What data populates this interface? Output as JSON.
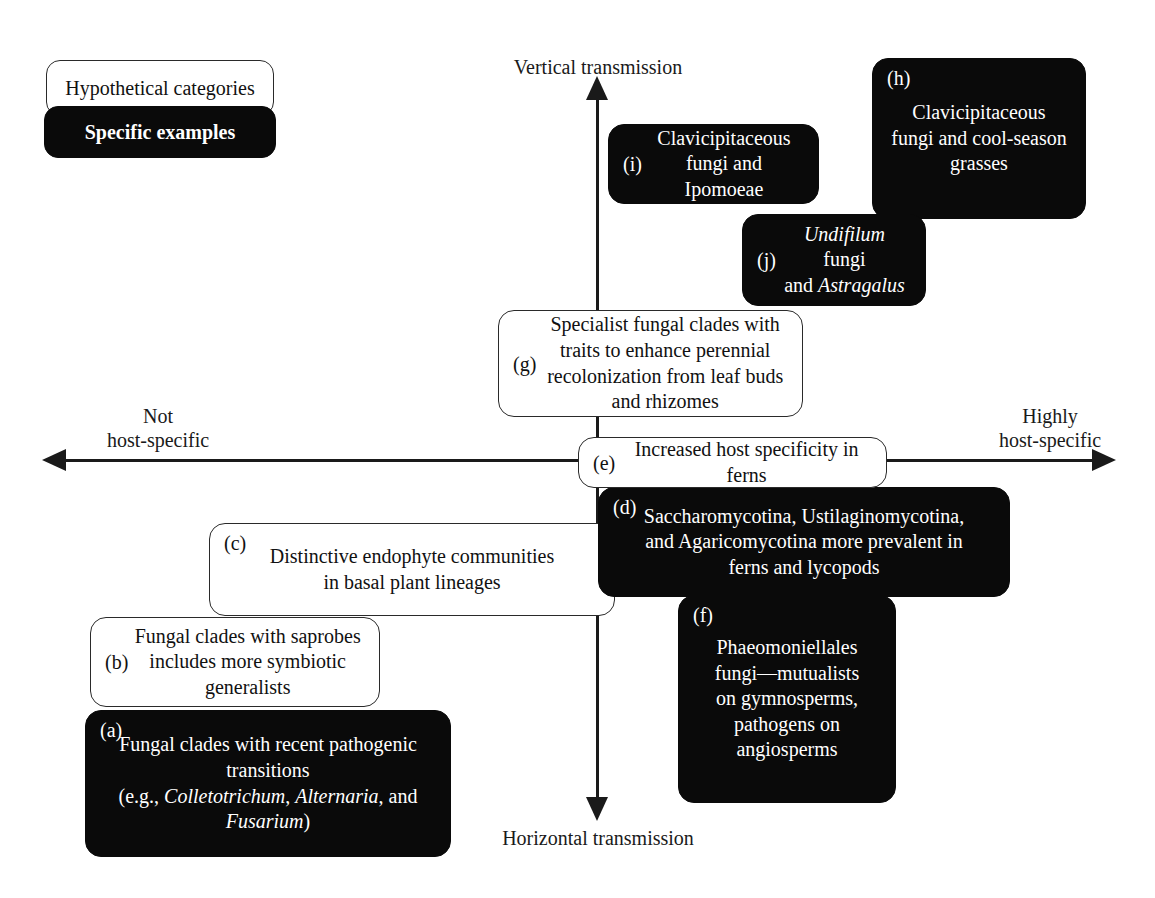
{
  "legend": {
    "hypothetical_label": "Hypothetical categories",
    "specific_label": "Specific examples",
    "hypothetical_color": "#ffffff",
    "specific_color": "#0a0a0a"
  },
  "axes": {
    "vertical_top_label": "Vertical transmission",
    "vertical_bottom_label": "Horizontal transmission",
    "horizontal_left_label": "Not\nhost-specific",
    "horizontal_right_label": "Highly\nhost-specific",
    "axis_color": "#1a1a1a"
  },
  "boxes": {
    "a": {
      "tag": "(a)",
      "style": "specific",
      "text_html": "Fungal clades with recent pathogenic\ntransitions\n(e.g., <i>Colletotrichum</i>, <i>Alternaria</i>, and\n<i>Fusarium</i>)",
      "text": "Fungal clades with recent pathogenic transitions (e.g., Colletotrichum, Alternaria, and Fusarium)"
    },
    "b": {
      "tag": "(b)",
      "style": "hypothetical",
      "text_html": "Fungal clades with saprobes\nincludes more symbiotic\ngeneralists",
      "text": "Fungal clades with saprobes includes more symbiotic generalists"
    },
    "c": {
      "tag": "(c)",
      "style": "hypothetical",
      "text_html": "Distinctive endophyte communities\nin basal plant lineages",
      "text": "Distinctive endophyte communities in basal plant lineages"
    },
    "d": {
      "tag": "(d)",
      "style": "specific",
      "text_html": "Saccharomycotina, Ustilaginomycotina,\nand Agaricomycotina more prevalent in\nferns and lycopods",
      "text": "Saccharomycotina, Ustilaginomycotina, and Agaricomycotina more prevalent in ferns and lycopods"
    },
    "e": {
      "tag": "(e)",
      "style": "hypothetical",
      "text_html": "Increased host specificity in\nferns",
      "text": "Increased host specificity in ferns"
    },
    "f": {
      "tag": "(f)",
      "style": "specific",
      "text_html": "Phaeomoniellales\nfungi—mutualists\non gymnosperms,\npathogens on\nangiosperms",
      "text": "Phaeomoniellales fungi—mutualists on gymnosperms, pathogens on angiosperms"
    },
    "g": {
      "tag": "(g)",
      "style": "hypothetical",
      "text_html": "Specialist fungal clades with\ntraits to enhance perennial\nrecolonization from leaf buds\nand rhizomes",
      "text": "Specialist fungal clades with traits to enhance perennial recolonization from leaf buds and rhizomes"
    },
    "h": {
      "tag": "(h)",
      "style": "specific",
      "text_html": "Clavicipitaceous\nfungi and cool-season\ngrasses",
      "text": "Clavicipitaceous fungi and cool-season grasses"
    },
    "i": {
      "tag": "(i)",
      "style": "specific",
      "text_html": "Clavicipitaceous\nfungi and Ipomoeae",
      "text": "Clavicipitaceous fungi and Ipomoeae"
    },
    "j": {
      "tag": "(j)",
      "style": "specific",
      "text_html": "<i>Undifilum</i> fungi\nand <i>Astragalus</i>",
      "text": "Undifilum fungi and Astragalus"
    }
  }
}
